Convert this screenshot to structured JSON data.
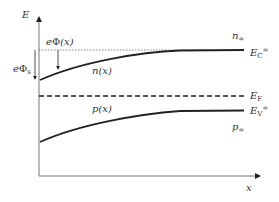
{
  "diagram": {
    "type": "energy-band-diagram",
    "axes": {
      "y_label": "E",
      "x_label": "x"
    },
    "labels": {
      "potential": {
        "prefix": "e",
        "symbol": "Φ",
        "arg": "(x)"
      },
      "surface_potential": {
        "prefix": "e",
        "symbol": "Φ",
        "sub": "s"
      },
      "n_x": {
        "symbol": "n",
        "arg": "(x)"
      },
      "p_x": {
        "symbol": "p",
        "arg": "(x)"
      },
      "n_inf": {
        "symbol": "n",
        "sub": "∞"
      },
      "p_inf": {
        "symbol": "p",
        "sub": "∞"
      },
      "ec_inf": {
        "symbol": "E",
        "sub": "C",
        "sup": "∞"
      },
      "ef": {
        "symbol": "E",
        "sub": "F"
      },
      "ev_inf": {
        "symbol": "E",
        "sub": "V",
        "sup": "∞"
      }
    },
    "curves": [
      {
        "name": "conduction-band-edge",
        "style": "solid",
        "color": "#222222"
      },
      {
        "name": "fermi-level",
        "style": "dashed",
        "color": "#222222"
      },
      {
        "name": "valence-band-edge",
        "style": "solid",
        "color": "#222222"
      },
      {
        "name": "bulk-conduction-reference",
        "style": "dotted",
        "color": "#555555"
      }
    ]
  }
}
